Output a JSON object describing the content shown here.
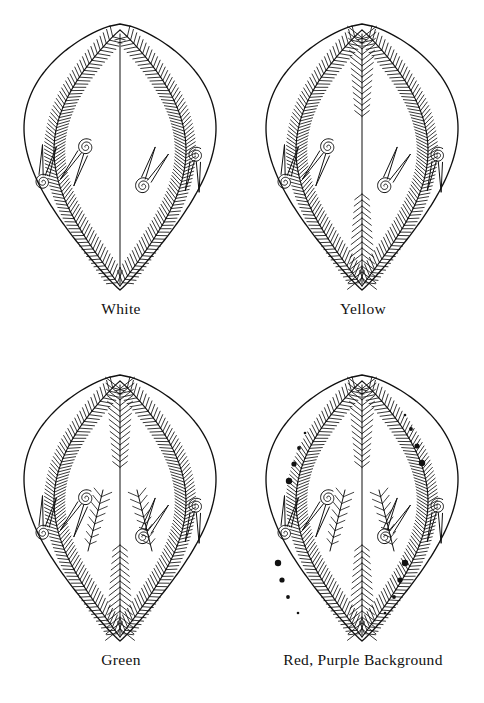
{
  "figure": {
    "type": "illustration-grid",
    "background_color": "#ffffff",
    "ink_color": "#111111",
    "columns": 2,
    "rows": 2
  },
  "panels": [
    {
      "label": "White",
      "motif_name": "egg-white",
      "features": {
        "outline": true,
        "center_line": true,
        "feather_arcs": 2,
        "center_feathering": false,
        "inner_sprigs": false,
        "dots": false,
        "spirals": 4
      }
    },
    {
      "label": "Yellow",
      "motif_name": "egg-yellow",
      "features": {
        "outline": true,
        "center_line": true,
        "feather_arcs": 2,
        "center_feathering": true,
        "inner_sprigs": false,
        "dots": false,
        "spirals": 4
      }
    },
    {
      "label": "Green",
      "motif_name": "egg-green",
      "features": {
        "outline": true,
        "center_line": true,
        "feather_arcs": 2,
        "center_feathering": true,
        "inner_sprigs": true,
        "dots": false,
        "spirals": 4
      }
    },
    {
      "label": "Red, Purple Background",
      "motif_name": "egg-red-purple",
      "features": {
        "outline": true,
        "center_line": true,
        "feather_arcs": 2,
        "center_feathering": true,
        "inner_sprigs": true,
        "dots": true,
        "spirals": 4
      }
    }
  ]
}
